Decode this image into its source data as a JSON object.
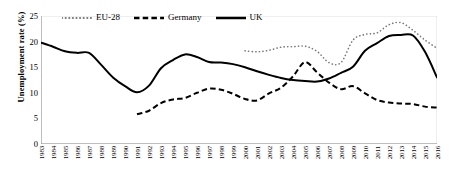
{
  "chart_data": {
    "type": "line",
    "title": "",
    "xlabel": "",
    "ylabel": "Unemployment rate (%)",
    "ylim": [
      0,
      25
    ],
    "yticks": [
      0,
      5,
      10,
      15,
      20,
      25
    ],
    "xlim": [
      1983,
      2016
    ],
    "grid": false,
    "legend_position": "top-left",
    "categories": [
      "1983",
      "1984",
      "1985",
      "1986",
      "1987",
      "1988",
      "1989",
      "1990",
      "1991",
      "1992",
      "1993",
      "1994",
      "1995",
      "1996",
      "1997",
      "1998",
      "1999",
      "2000",
      "2001",
      "2002",
      "2003",
      "2004",
      "2005",
      "2006",
      "2007",
      "2008",
      "2009",
      "2010",
      "2011",
      "2012",
      "2013",
      "2014",
      "2015",
      "2016"
    ],
    "series": [
      {
        "name": "EU-28",
        "style": "dotted",
        "color": "#7a7a7a",
        "start_year": 2000,
        "values": [
          null,
          null,
          null,
          null,
          null,
          null,
          null,
          null,
          null,
          null,
          null,
          null,
          null,
          null,
          null,
          null,
          null,
          18.2,
          18.0,
          18.3,
          18.9,
          19.0,
          19.1,
          18.1,
          15.9,
          15.9,
          20.3,
          21.4,
          21.7,
          23.3,
          23.7,
          22.2,
          20.3,
          18.7
        ]
      },
      {
        "name": "Germany",
        "style": "dashed",
        "color": "#000000",
        "start_year": 1991,
        "values": [
          null,
          null,
          null,
          null,
          null,
          null,
          null,
          null,
          5.8,
          6.5,
          8.0,
          8.7,
          9.0,
          10.0,
          10.8,
          10.6,
          9.8,
          8.8,
          8.5,
          9.9,
          11.0,
          13.2,
          16.0,
          14.0,
          12.0,
          10.7,
          11.3,
          9.9,
          8.6,
          8.1,
          7.9,
          7.8,
          7.3,
          7.1
        ]
      },
      {
        "name": "UK",
        "style": "solid",
        "color": "#000000",
        "start_year": 1983,
        "values": [
          19.8,
          19.0,
          18.1,
          17.8,
          17.8,
          15.5,
          13.0,
          11.3,
          10.1,
          11.4,
          14.8,
          16.4,
          17.5,
          17.0,
          16.0,
          15.9,
          15.6,
          15.0,
          14.2,
          13.5,
          12.9,
          12.5,
          12.3,
          12.2,
          12.8,
          13.9,
          15.1,
          18.2,
          19.7,
          21.1,
          21.3,
          21.2,
          18.0,
          13.0
        ]
      }
    ]
  },
  "legend": {
    "items": [
      {
        "label": "EU-28",
        "style": "dotted"
      },
      {
        "label": "Germany",
        "style": "dashed"
      },
      {
        "label": "UK",
        "style": "solid"
      }
    ]
  },
  "axes": {
    "ylabel": "Unemployment rate (%)",
    "yticks": [
      "0",
      "5",
      "10",
      "15",
      "20",
      "25"
    ],
    "xticks": [
      "1983",
      "1984",
      "1985",
      "1986",
      "1987",
      "1988",
      "1989",
      "1990",
      "1991",
      "1992",
      "1993",
      "1994",
      "1995",
      "1996",
      "1997",
      "1998",
      "1999",
      "2000",
      "2001",
      "2002",
      "2003",
      "2004",
      "2005",
      "2006",
      "2007",
      "2008",
      "2009",
      "2010",
      "2011",
      "2012",
      "2013",
      "2014",
      "2015",
      "2016"
    ]
  }
}
